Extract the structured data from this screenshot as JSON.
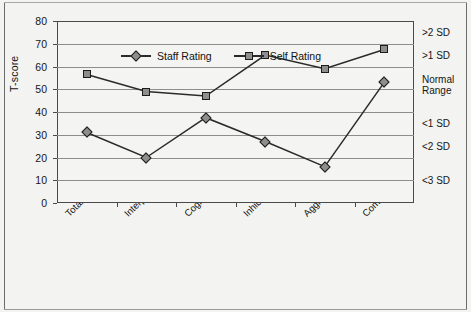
{
  "chart_data": {
    "type": "line",
    "title": "",
    "xlabel": "",
    "ylabel": "T-score",
    "ylim": [
      0,
      80
    ],
    "ytick_step": 10,
    "yticks": [
      "0",
      "10",
      "20",
      "30",
      "40",
      "50",
      "60",
      "70",
      "80"
    ],
    "grid": true,
    "legend_position": "top-left inside plot",
    "categories": [
      "Total Ratings",
      "Interpersonal Relationships",
      "Cognition",
      "Inhibition",
      "Aggression",
      "Communication"
    ],
    "series": [
      {
        "name": "Staff Rating",
        "marker": "diamond",
        "values": [
          31,
          20,
          37.5,
          27,
          16,
          53
        ]
      },
      {
        "name": "Self Rating",
        "marker": "square",
        "values": [
          56.5,
          49,
          47,
          65,
          59,
          67.5
        ]
      }
    ],
    "secondary_axis_labels": [
      {
        "text": "&gt;2 SD",
        "center_value": 75
      },
      {
        "text": "&gt;1 SD",
        "center_value": 65
      },
      {
        "text": "Normal\nRange",
        "center_value": 52
      },
      {
        "text": "&lt;1 SD",
        "center_value": 35
      },
      {
        "text": "&lt;2 SD",
        "center_value": 25
      },
      {
        "text": "&lt;3 SD",
        "center_value": 10
      }
    ],
    "colors": {
      "marker_fill": "#8e8e8e",
      "marker_edge": "#1c1c1c",
      "line": "#2a2a2a",
      "gridline": "#8d8d8d",
      "axis": "#4a4a4a",
      "plot_background": "#f4f4f2",
      "figure_background": "#f3f3f1",
      "text": "#161616"
    }
  },
  "legend": {
    "entries": [
      {
        "label": "Staff Rating",
        "marker": "diamond-marker-icon"
      },
      {
        "label": "Self Rating",
        "marker": "square-marker-icon"
      }
    ]
  },
  "axis": {
    "y_title": "T-score"
  }
}
